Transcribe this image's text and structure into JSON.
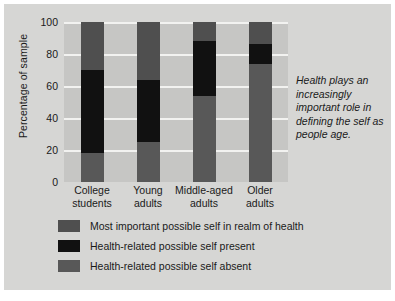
{
  "chart_data": {
    "type": "bar",
    "subtype": "stacked-bar",
    "title": "",
    "xlabel": "",
    "ylabel": "Percentage of sample",
    "categories": [
      "College students",
      "Young adults",
      "Middle-aged adults",
      "Older adults"
    ],
    "category_lines": [
      [
        "College",
        "students"
      ],
      [
        "Young",
        "adults"
      ],
      [
        "Middle-aged",
        "adults"
      ],
      [
        "Older",
        "adults"
      ]
    ],
    "ylim": [
      0,
      100
    ],
    "yticks": [
      0,
      20,
      40,
      60,
      80,
      100
    ],
    "grid": true,
    "grid_axis": "y",
    "legend_position": "below",
    "stack_order_bottom_to_top": [
      "Health-related possible self absent",
      "Health-related possible self present",
      "Most important possible self in realm of health"
    ],
    "series": [
      {
        "name": "Health-related possible self absent",
        "color": "#585858",
        "values": [
          18,
          25,
          54,
          74
        ]
      },
      {
        "name": "Health-related possible self present",
        "color": "#111111",
        "values": [
          52,
          39,
          34,
          12
        ]
      },
      {
        "name": "Most important possible self in realm of health",
        "color": "#4f4f4f",
        "values": [
          30,
          36,
          12,
          14
        ]
      }
    ],
    "annotations": [
      {
        "text": "Health plays an increasingly important role in defining the self as people age.",
        "style": "italic",
        "position": "right"
      }
    ]
  },
  "axis": {
    "ylabel": "Percentage of sample",
    "yticks": [
      "100",
      "80",
      "60",
      "40",
      "20",
      "0"
    ]
  },
  "xlabels": [
    {
      "line1": "College",
      "line2": "students"
    },
    {
      "line1": "Young",
      "line2": "adults"
    },
    {
      "line1": "Middle-aged",
      "line2": "adults"
    },
    {
      "line1": "Older",
      "line2": "adults"
    }
  ],
  "annotation": {
    "text": "Health plays an increasingly important role in defining the self as people age."
  },
  "legend": {
    "items": [
      {
        "label": "Most important possible self in realm of health",
        "color": "#4f4f4f"
      },
      {
        "label": "Health-related possible self present",
        "color": "#111111"
      },
      {
        "label": "Health-related possible self absent",
        "color": "#585858"
      }
    ]
  },
  "colors": {
    "figure_background": "#d6d6d4",
    "plot_background": "#c6c6c4",
    "gridline": "#f2f2f0",
    "text": "#1a1a1a"
  }
}
